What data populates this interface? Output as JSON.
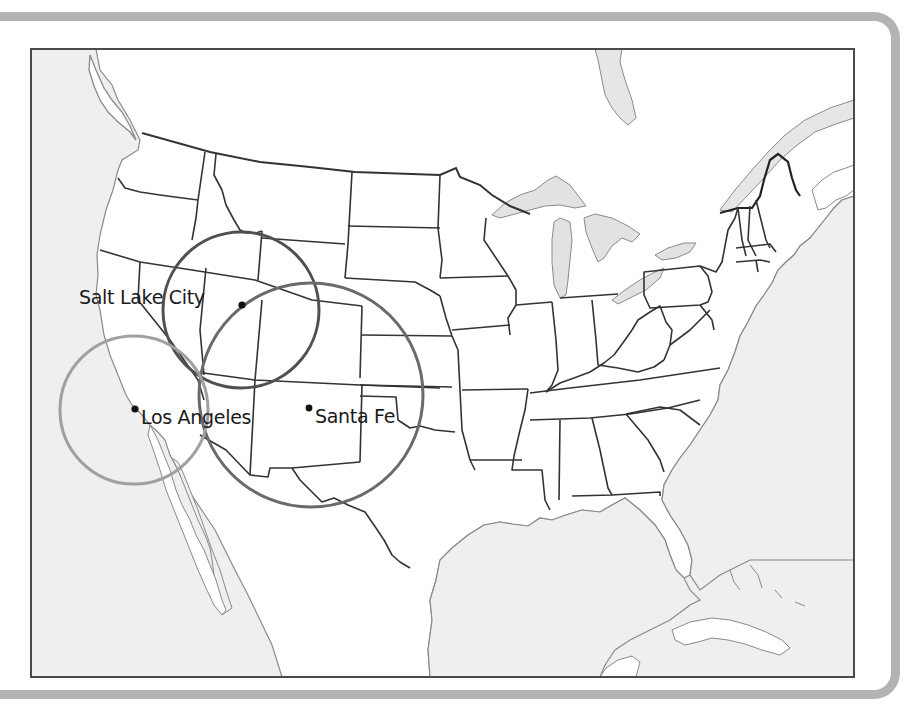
{
  "figure": {
    "type": "map",
    "region": "Contiguous United States with parts of Canada, Mexico and the Caribbean",
    "style": "grayscale outline map with state borders",
    "colors": {
      "frame_border": "#b3b3b3",
      "map_border": "#4a4a4a",
      "land": "#ffffff",
      "water": "#efefef",
      "lakes": "#e2e2e2",
      "state_lines": "#333333",
      "coast_lines": "#8a8a8a"
    }
  },
  "cities": [
    {
      "name": "Salt Lake City",
      "dot": [
        242,
        305
      ],
      "label_pos": "left"
    },
    {
      "name": "Los Angeles",
      "dot": [
        135,
        409
      ],
      "label_pos": "right"
    },
    {
      "name": "Santa Fe",
      "dot": [
        309,
        408
      ],
      "label_pos": "right"
    }
  ],
  "circles": [
    {
      "center_city": "Salt Lake City",
      "cx": 241,
      "cy": 310,
      "r": 78,
      "stroke": "#505050"
    },
    {
      "center_city": "Santa Fe",
      "cx": 311,
      "cy": 395,
      "r": 112,
      "stroke": "#6a6a6a"
    },
    {
      "center_city": "Los Angeles",
      "cx": 134,
      "cy": 410,
      "r": 74,
      "stroke": "#a0a0a0"
    }
  ],
  "labels": {
    "salt_lake_city": "Salt Lake City",
    "los_angeles": "Los Angeles",
    "santa_fe": "Santa Fe"
  }
}
